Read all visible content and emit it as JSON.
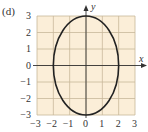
{
  "panel_label": "(d)",
  "colors": {
    "grid_bg": "#fbeed8",
    "grid_line": "#c8b89a",
    "curve": "#222222",
    "axis": "#333333"
  },
  "chart_data": {
    "type": "line",
    "title": "(d)",
    "xlabel": "x",
    "ylabel": "y",
    "xlim": [
      -3,
      3
    ],
    "ylim": [
      -3,
      3
    ],
    "grid": true,
    "x_ticks": [
      "-3",
      "-2",
      "-1",
      "0",
      "1",
      "2",
      "3"
    ],
    "y_ticks": [
      "3",
      "2",
      "1",
      "0",
      "-1",
      "-2",
      "-3"
    ],
    "series": [
      {
        "name": "ellipse",
        "equation": "x^2/4 + y^2/9 = 1",
        "semi_axis_x": 2,
        "semi_axis_y": 3,
        "center": [
          0,
          0
        ]
      }
    ]
  }
}
